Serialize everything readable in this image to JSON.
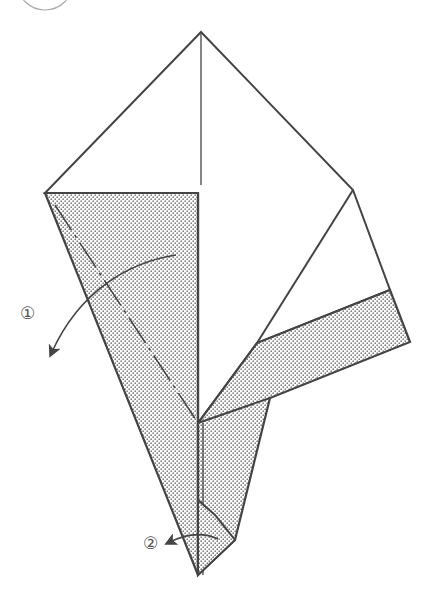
{
  "diagram": {
    "type": "origami-folding-step",
    "step_circle": "partial circle at top-left (step number indicator, cropped)",
    "labels": [
      {
        "id": "step-1",
        "text": "①",
        "description": "fold flap left along dashed valley line"
      },
      {
        "id": "step-2",
        "text": "②",
        "description": "fold bottom tip to the left"
      }
    ],
    "colors": {
      "line": "#444444",
      "shade_dots": "#777777",
      "background": "#ffffff"
    }
  }
}
